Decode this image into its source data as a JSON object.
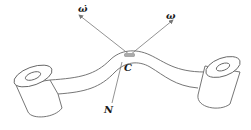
{
  "diagram": {
    "type": "mechanics-free-body",
    "labels": {
      "omega_dot": "ω̇",
      "omega": "ω",
      "contact_point": "C",
      "normal_force": "N"
    },
    "colors": {
      "stroke": "#555555",
      "arrow": "#777777",
      "text": "#1a1a1a",
      "contact_mark": "#888888"
    }
  }
}
